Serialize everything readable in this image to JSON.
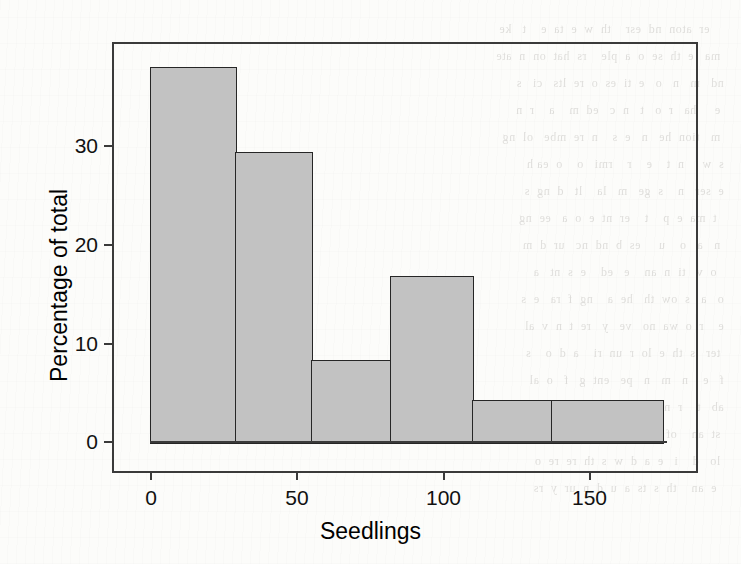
{
  "figure": {
    "background_color": "#fdfdfb",
    "bar_fill_color": "#c2c2c2",
    "bar_edge_color": "#262626",
    "axis_color": "#3a3a3a",
    "text_color": "#111111"
  },
  "chart_data": {
    "type": "bar",
    "title": "",
    "subtitle": "",
    "xlabel": "Seedlings",
    "ylabel": "Percentage of total",
    "grid": false,
    "legend": null,
    "legend_position": "none",
    "xlim": [
      0,
      175
    ],
    "ylim": [
      0,
      40
    ],
    "xticks": [
      0,
      50,
      100,
      150
    ],
    "xticklabels": [
      "0",
      "50",
      "100",
      "150"
    ],
    "yticks": [
      0,
      10,
      20,
      30
    ],
    "yticklabels": [
      "0",
      "10",
      "20",
      "30"
    ],
    "bin_width": 29,
    "bin_edges": [
      0,
      29,
      55,
      82,
      110,
      137,
      175
    ],
    "categories": [
      "0-29",
      "29-55",
      "55-82",
      "82-110",
      "110-137",
      "137-175"
    ],
    "values": [
      37.9,
      29.3,
      8.3,
      16.8,
      4.3,
      4.3
    ],
    "annotations": []
  },
  "ghost_text": "      er  aton  nd  esr    th  w  e  ta  e    t   ke\n   ma   e  th  se  o  a  ple    rs  hat  on  n  ate\n  nd   m   n   o   e  ti  es  o  re  lts   ci   s\n   e     ha   r  o   t   n  c   ed  m    a    r  n\n   m   tion  he   n   e  s    n  re  mbe   ol  ng\n  s  w     n  t    e    r    rmi   o    o  ea h\n  e  ser   n    s  ge   m   la    lt   d  ng  s\n    t  ma  e  p    t    er  nt  e  o  a   ee  ng\n   n   a   o    u     es  b  nd  nc   ur  d  m\n    o  v   ti  n  an    e   ed    e  s  nt   a\n  o   a   s  ow  th   he  a    ng  f  ra   e  s\n  e    r  o  wa  no   ve   y   re  t  n  v  al\n   ter   s  th  e  lo  r  un  ri    a  d  o    s\n  f   e    n   m   n   pe   ent  g   f   o  al\n  ab   t    r  nt   ch  wa  o   ed  n  th   gh\n   st  an    of  e  se  li   s  ou   d  n  he\n   lo   d    i   e  a  d  w  s  th  re  re  o\n    e  an    th  s  ts  a  u  d  n  ur  y  rs"
}
